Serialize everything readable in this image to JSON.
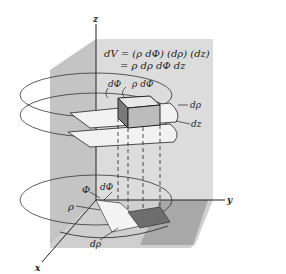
{
  "diagram": {
    "formula_line1": "dV = (ρ dΦ) (dρ) (dz)",
    "formula_line2": "= ρ dρ dΦ dz",
    "axes": {
      "x": "x",
      "y": "y",
      "z": "z"
    },
    "labels": {
      "dphi_top": "dΦ",
      "rho_dphi": "ρ dΦ",
      "drho_right": "dρ",
      "dz_right": "dz",
      "phi_base": "Φ",
      "dphi_base": "dΦ",
      "rho_base": "ρ",
      "drho_base": "dρ"
    },
    "colors": {
      "plane_light": "#d9d9d9",
      "plane_mid": "#bdbdbd",
      "element_dark": "#6e6e6e",
      "line": "#222222"
    }
  }
}
